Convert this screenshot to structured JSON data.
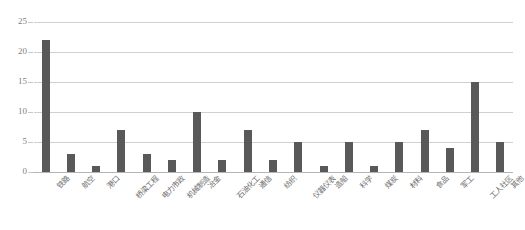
{
  "chart_data": {
    "type": "bar",
    "title": "",
    "xlabel": "",
    "ylabel": "",
    "ylim": [
      0,
      25
    ],
    "ytick_labels": [
      "0",
      "5",
      "10",
      "15",
      "20",
      "25"
    ],
    "ytick_values": [
      0,
      5,
      10,
      15,
      20,
      25
    ],
    "grid": true,
    "legend": "none",
    "bar_color": "#595959",
    "gridline_color": "#d0d0d0",
    "axis_text_color": "#808080",
    "categories": [
      "铁路",
      "航空",
      "港口",
      "桥梁工程",
      "电力市政",
      "机械制造",
      "冶金",
      "石油化工",
      "通信",
      "纺织",
      "仪器仪表",
      "造船",
      "科学",
      "煤炭",
      "材料",
      "食品",
      "军工",
      "工人社区",
      "其他"
    ],
    "values": [
      22,
      3,
      1,
      7,
      3,
      2,
      10,
      2,
      7,
      2,
      5,
      1,
      5,
      1,
      5,
      7,
      4,
      15,
      5
    ]
  }
}
